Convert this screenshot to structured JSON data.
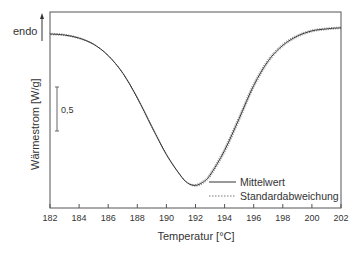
{
  "chart_data": {
    "type": "line",
    "title": "",
    "xlabel": "Temperatur [°C]",
    "ylabel": "Wärmestrom [W/g]",
    "xlim": [
      182,
      202
    ],
    "x_ticks": [
      182,
      184,
      186,
      188,
      190,
      192,
      194,
      196,
      198,
      200,
      202
    ],
    "x_tick_labels": [
      "182",
      "184",
      "186",
      "188",
      "190",
      "192",
      "194",
      "196",
      "198",
      "200",
      "202"
    ],
    "y_ticks": [],
    "grid": false,
    "legend_position": "lower right",
    "annotations": {
      "direction_label": "endo",
      "direction_arrow": "up",
      "scale_bar_label": "0,5",
      "scale_bar_units": "W/g"
    },
    "series": [
      {
        "name": "Mittelwert",
        "style": "solid",
        "x": [
          182,
          183,
          184,
          185,
          186,
          187,
          188,
          189,
          190,
          191,
          191.5,
          192,
          192.5,
          193,
          194,
          195,
          196,
          197,
          198,
          199,
          200,
          201,
          202
        ],
        "y_relative": [
          0.0,
          -0.01,
          -0.04,
          -0.1,
          -0.21,
          -0.38,
          -0.62,
          -0.9,
          -1.17,
          -1.38,
          -1.45,
          -1.47,
          -1.44,
          -1.37,
          -1.13,
          -0.82,
          -0.5,
          -0.26,
          -0.11,
          -0.02,
          0.03,
          0.05,
          0.06
        ]
      },
      {
        "name": "Standardabweichung",
        "style": "dotted",
        "note": "error band closely following Mittelwert (±small)"
      }
    ]
  },
  "labels": {
    "endo": "endo",
    "scale": "0,5",
    "xlabel": "Temperatur [°C]",
    "ylabel": "Wärmestrom [W/g]",
    "legend_mean": "Mittelwert",
    "legend_std": "Standardabweichung"
  }
}
